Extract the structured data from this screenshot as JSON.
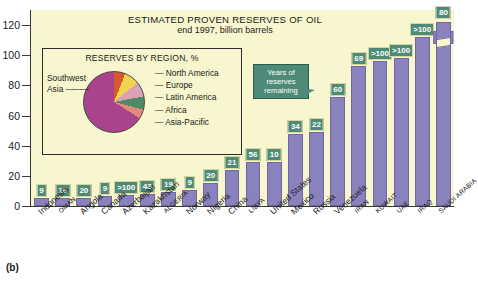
{
  "figure_label": "(b)",
  "chart_data": {
    "type": "bar",
    "title": "ESTIMATED PROVEN RESERVES OF OIL",
    "subtitle": "end 1997, billion barrels",
    "xlabel": "",
    "ylabel": "",
    "ylim": [
      0,
      130
    ],
    "yticks": [
      0,
      20,
      40,
      60,
      80,
      100,
      120
    ],
    "grid": false,
    "legend": "none",
    "categories": [
      "Indonesia",
      "OMAN",
      "Angola",
      "Canada",
      "Azerbaijan",
      "Kazakhstan",
      "ALGERIA",
      "Norway",
      "Nigeria",
      "China",
      "LIBYA",
      "United States",
      "Mexico",
      "Russia",
      "Venezuela",
      "IRAN",
      "KUWAIT",
      "UAE",
      "IRAQ",
      "SAUDI ARABIA"
    ],
    "label_caps": [
      false,
      true,
      false,
      false,
      false,
      false,
      true,
      false,
      false,
      false,
      true,
      false,
      false,
      false,
      false,
      true,
      true,
      true,
      true,
      true
    ],
    "values": [
      5,
      5,
      5.4,
      6.4,
      7,
      8,
      9.2,
      10.4,
      15.5,
      24,
      29.5,
      29,
      48,
      49,
      72,
      93,
      96,
      98,
      112,
      262
    ],
    "series": [
      {
        "name": "Proven reserves (billion barrels)",
        "values": [
          5,
          5,
          5.4,
          6.4,
          7,
          8,
          9.2,
          10.4,
          15.5,
          24,
          29.5,
          29,
          48,
          49,
          72,
          93,
          96,
          98,
          112,
          262
        ]
      },
      {
        "name": "Years of reserves remaining",
        "values": [
          "9",
          "16",
          "20",
          "9",
          ">100",
          "43",
          "19",
          "9",
          "20",
          "21",
          "56",
          "10",
          "34",
          "22",
          "60",
          "69",
          ">100",
          ">100",
          ">100",
          "80"
        ]
      }
    ],
    "value_labels": [
      "9",
      "16",
      "20",
      "9",
      ">100",
      "43",
      "19",
      "9",
      "20",
      "21",
      "56",
      "10",
      "34",
      "22",
      "60",
      "69",
      ">100",
      ">100",
      ">100",
      "80"
    ],
    "axis_break_note": "262",
    "callout": "Years of reserves remaining",
    "bar_color": "#8a82bd",
    "label_box_color": "#4e8a78",
    "background_color": "#f8f6cf"
  },
  "inset": {
    "title": "RESERVES BY REGION, %",
    "type": "pie",
    "slices": [
      {
        "label": "North America",
        "color": "#d9572c",
        "percent": 6
      },
      {
        "label": "Europe",
        "color": "#f2d54e",
        "percent": 8
      },
      {
        "label": "Latin America",
        "color": "#d9a2b5",
        "percent": 8
      },
      {
        "label": "Africa",
        "color": "#4e8a65",
        "percent": 7
      },
      {
        "label": "Asia-Pacific",
        "color": "#e08a7a",
        "percent": 5
      },
      {
        "label": "Southwest Asia",
        "color": "#a8438c",
        "percent": 66
      }
    ],
    "left_label": "Southwest Asia",
    "legend_items": [
      "North America",
      "Europe",
      "Latin America",
      "Africa",
      "Asia-Pacific"
    ]
  }
}
